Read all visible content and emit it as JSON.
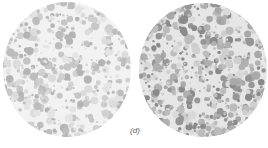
{
  "figure": {
    "caption": "(d)",
    "plates": [
      {
        "id": "c",
        "description": "light grey dotted color-vision plate",
        "background": "#f2f2f2",
        "dot_colors": [
          "#dcdcdc",
          "#d0d0d0",
          "#c6c6c6",
          "#bdbdbd",
          "#e4e4e4",
          "#b4b4b4"
        ],
        "dot_count": 620,
        "seed": 11
      },
      {
        "id": "d",
        "description": "darker grey dotted color-vision plate",
        "background": "#e6e6e6",
        "dot_colors": [
          "#cfcfcf",
          "#bcbcbc",
          "#a8a8a8",
          "#969696",
          "#8a8a8a",
          "#d9d9d9",
          "#b0b0b0"
        ],
        "dot_count": 780,
        "seed": 29
      }
    ]
  }
}
